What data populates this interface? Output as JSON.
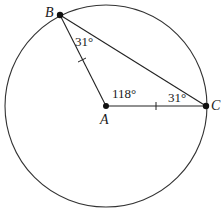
{
  "diagram": {
    "points": {
      "A": {
        "label": "A",
        "x": 106,
        "y": 106
      },
      "B": {
        "label": "B",
        "x": 60,
        "y": 15
      },
      "C": {
        "label": "C",
        "x": 206,
        "y": 106
      }
    },
    "circle": {
      "cx": 106,
      "cy": 106,
      "r": 101
    },
    "angles": {
      "at_A": "118°",
      "at_B": "31°",
      "at_C": "31°"
    },
    "stroke_color": "#222222"
  }
}
